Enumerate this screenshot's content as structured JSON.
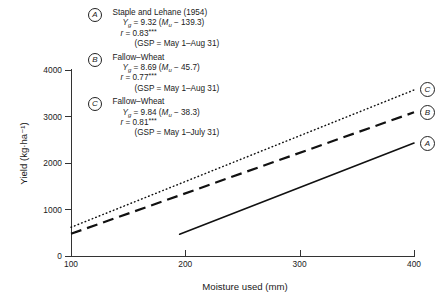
{
  "chart_data": {
    "type": "line",
    "title": "",
    "xlabel": "Moisture used (mm)",
    "ylabel": "Yield (kg·ha⁻¹)",
    "xlim": [
      100,
      400
    ],
    "ylim": [
      0,
      4000
    ],
    "xticks": [
      "100",
      "200",
      "300",
      "400"
    ],
    "yticks": [
      "0",
      "1000",
      "2000",
      "3000",
      "4000"
    ],
    "grid": false,
    "legend_position": "inside-top-left",
    "series": [
      {
        "name": "A",
        "label": "Staple and Lehane (1954)",
        "style": "solid",
        "slope": 9.32,
        "intercept_x": 139.3,
        "r": "0.83",
        "significance": "***",
        "gsp": "GSP = May 1–Aug 31",
        "x": [
          195,
          400
        ],
        "y": [
          460,
          2420
        ]
      },
      {
        "name": "B",
        "label": "Fallow–Wheat",
        "style": "dashed",
        "slope": 8.69,
        "intercept_x": 45.7,
        "r": "0.77",
        "significance": "***",
        "gsp": "GSP = May 1–Aug 31",
        "x": [
          100,
          400
        ],
        "y": [
          470,
          3080
        ]
      },
      {
        "name": "C",
        "label": "Fallow–Wheat",
        "style": "dotted",
        "slope": 9.84,
        "intercept_x": 38.3,
        "r": "0.81",
        "significance": "***",
        "gsp": "GSP = May 1–July 31",
        "x": [
          100,
          400
        ],
        "y": [
          610,
          3560
        ]
      }
    ]
  },
  "legend": {
    "entries": [
      {
        "badge": "A",
        "source": "Staple and Lehane (1954)",
        "eq_lhs": "Y",
        "eq_lhs_sub": "g",
        "eq_mid": " = 9.32 (",
        "eq_var": "M",
        "eq_var_sub": "u",
        "eq_tail": " − 139.3)",
        "r_lhs": "r",
        "r_val": " = 0.83",
        "r_stars": "***",
        "gsp": "(GSP = May 1–Aug 31)"
      },
      {
        "badge": "B",
        "source": "Fallow–Wheat",
        "eq_lhs": "Y",
        "eq_lhs_sub": "g",
        "eq_mid": " = 8.69 (",
        "eq_var": "M",
        "eq_var_sub": "u",
        "eq_tail": " − 45.7)",
        "r_lhs": "r",
        "r_val": " = 0.77",
        "r_stars": "***",
        "gsp": "(GSP = May 1–Aug 31)"
      },
      {
        "badge": "C",
        "source": "Fallow–Wheat",
        "eq_lhs": "Y",
        "eq_lhs_sub": "g",
        "eq_mid": " = 9.84 (",
        "eq_var": "M",
        "eq_var_sub": "u",
        "eq_tail": " − 38.3)",
        "r_lhs": "r",
        "r_val": " = 0.81",
        "r_stars": "***",
        "gsp": "(GSP = May 1–July 31)"
      }
    ]
  },
  "end_markers": [
    {
      "label": "A"
    },
    {
      "label": "B"
    },
    {
      "label": "C"
    }
  ],
  "colors": {
    "ink": "#1a1a1a",
    "axis": "#333333",
    "background": "#ffffff"
  }
}
